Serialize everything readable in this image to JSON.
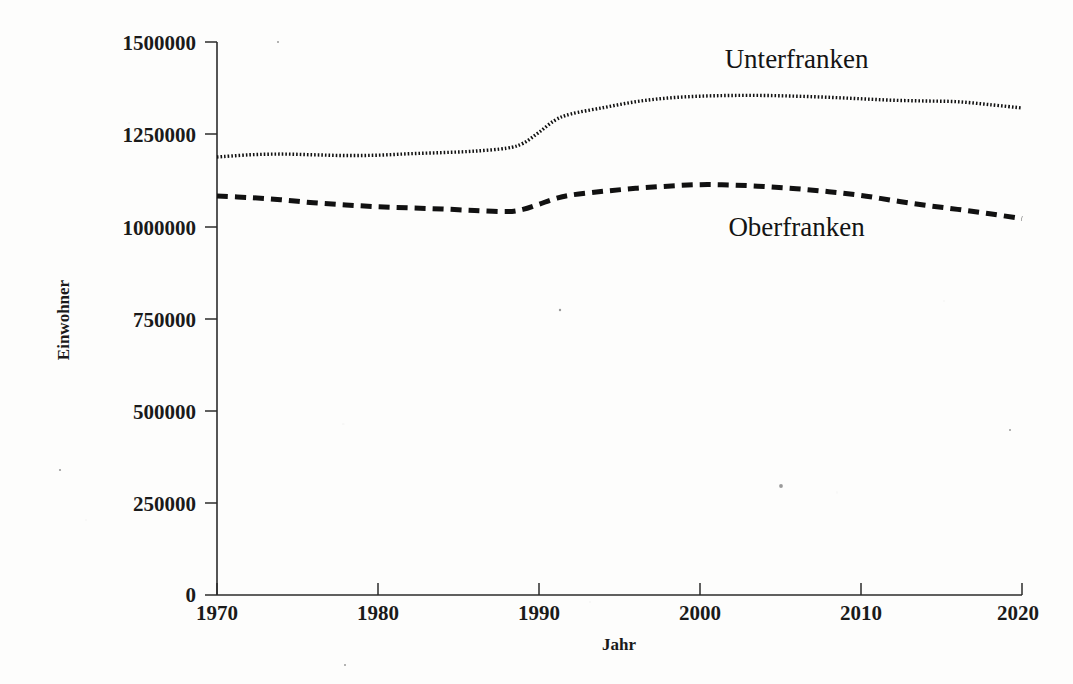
{
  "chart_data": {
    "type": "line",
    "title": "",
    "xlabel": "Jahr",
    "ylabel": "Einwohner",
    "xlim": [
      1970,
      2020
    ],
    "ylim": [
      0,
      1500000
    ],
    "xticks": [
      "1970",
      "1980",
      "1990",
      "2000",
      "2010",
      "2020"
    ],
    "yticks": [
      "0",
      "250000",
      "500000",
      "750000",
      "1000000",
      "1250000",
      "1500000"
    ],
    "grid": false,
    "legend_position": "inline-annotation",
    "x": [
      1970,
      1972,
      1974,
      1976,
      1978,
      1980,
      1982,
      1984,
      1986,
      1988,
      1989,
      1990,
      1991,
      1992,
      1994,
      1996,
      1998,
      2000,
      2002,
      2004,
      2006,
      2008,
      2010,
      2012,
      2014,
      2016,
      2018,
      2020
    ],
    "series": [
      {
        "name": "Unterfranken",
        "line_style": "dotted",
        "color": "#111111",
        "values": [
          1188000,
          1194000,
          1196000,
          1194000,
          1192000,
          1193000,
          1197000,
          1200000,
          1204000,
          1212000,
          1225000,
          1255000,
          1288000,
          1305000,
          1322000,
          1338000,
          1348000,
          1353000,
          1355000,
          1355000,
          1353000,
          1350000,
          1346000,
          1342000,
          1340000,
          1338000,
          1330000,
          1321000
        ]
      },
      {
        "name": "Oberfranken",
        "line_style": "dashed",
        "color": "#111111",
        "values": [
          1082000,
          1078000,
          1072000,
          1064000,
          1058000,
          1053000,
          1050000,
          1047000,
          1043000,
          1040000,
          1046000,
          1060000,
          1075000,
          1085000,
          1095000,
          1103000,
          1109000,
          1113000,
          1112000,
          1108000,
          1102000,
          1094000,
          1084000,
          1070000,
          1057000,
          1046000,
          1034000,
          1021000
        ]
      }
    ],
    "annotations": [
      {
        "text": "Unterfranken",
        "x": 2006,
        "y": 1430000
      },
      {
        "text": "Oberfranken",
        "x": 2006,
        "y": 975000
      }
    ]
  },
  "axes": {
    "x_axis_title": "Jahr",
    "y_axis_title": "Einwohner"
  }
}
